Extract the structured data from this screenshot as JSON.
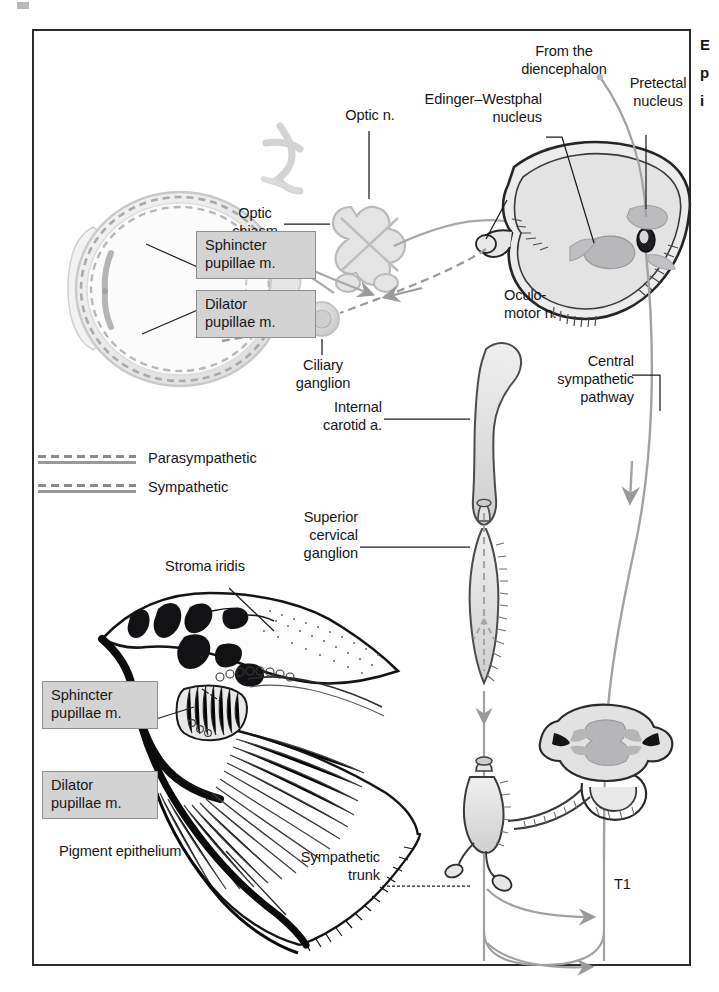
{
  "figure": {
    "title_truncated_margin": "E\np\ni",
    "labels": {
      "from_diencephalon": "From the\ndiencephalon",
      "pretectal_nucleus": "Pretectal\nnucleus",
      "edinger_westphal_nucleus": "Edinger–Westphal\nnucleus",
      "optic_n": "Optic n.",
      "optic_chiasm": "Optic\nchiasm",
      "oculomotor_n": "Oculo-\nmotor n.",
      "central_sympathetic_pathway": "Central\nsympathetic\npathway",
      "ciliary_ganglion": "Ciliary\nganglion",
      "internal_carotid_a": "Internal\ncarotid a.",
      "superior_cervical_ganglion": "Superior\ncervical\nganglion",
      "sympathetic_trunk": "Sympathetic\ntrunk",
      "t1": "T1",
      "stroma_iridis": "Stroma iridis",
      "pigment_epithelium": "Pigment epithelium",
      "sphincter_pupillae_eye": "Sphincter\npupillae m.",
      "dilator_pupillae_eye": "Dilator\npupillae m.",
      "sphincter_pupillae_iris": "Sphincter\npupillae m.",
      "dilator_pupillae_iris": "Dilator\npupillae m."
    },
    "legend": [
      {
        "name": "parasympathetic",
        "label": "Parasympathetic"
      },
      {
        "name": "sympathetic",
        "label": "Sympathetic"
      }
    ],
    "colors": {
      "frame": "#2b2b2e",
      "label_text": "#161619",
      "box_fill": "#d3d3d3",
      "box_border": "#8f8f92",
      "pathway_line": "#9a9a9d",
      "ink": "#1b1b1e",
      "tissue_light": "#efefef",
      "tissue_mid": "#d8d8d8",
      "tissue_dark": "#b4b4b4"
    }
  }
}
